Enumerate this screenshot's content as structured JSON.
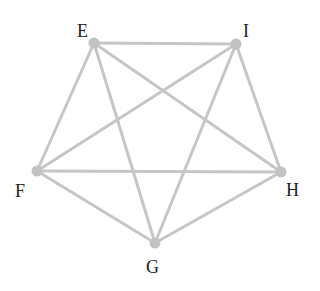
{
  "graph": {
    "type": "complete-graph-K5",
    "edge_color": "#c6c6c6",
    "node_color": "#c2c2c2",
    "label_color": "#222222",
    "nodes": [
      {
        "id": "E",
        "label": "E",
        "x": 94,
        "y": 43,
        "lx": 77,
        "ly": 22
      },
      {
        "id": "I",
        "label": "I",
        "x": 236,
        "y": 44,
        "lx": 243,
        "ly": 22
      },
      {
        "id": "F",
        "label": "F",
        "x": 37,
        "y": 171,
        "lx": 15,
        "ly": 182
      },
      {
        "id": "H",
        "label": "H",
        "x": 281,
        "y": 172,
        "lx": 286,
        "ly": 181
      },
      {
        "id": "G",
        "label": "G",
        "x": 155,
        "y": 243,
        "lx": 146,
        "ly": 258
      }
    ],
    "edges": [
      [
        "E",
        "I"
      ],
      [
        "E",
        "F"
      ],
      [
        "E",
        "H"
      ],
      [
        "E",
        "G"
      ],
      [
        "I",
        "F"
      ],
      [
        "I",
        "H"
      ],
      [
        "I",
        "G"
      ],
      [
        "F",
        "H"
      ],
      [
        "F",
        "G"
      ],
      [
        "H",
        "G"
      ]
    ]
  }
}
